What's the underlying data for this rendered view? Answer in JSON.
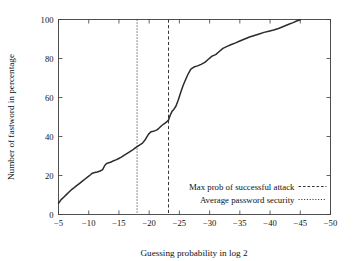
{
  "chart_data": {
    "type": "line",
    "title": "",
    "xlabel": "Guessing probability in log 2",
    "ylabel": "Number of fastword in percentage",
    "xlim": [
      -5,
      -50
    ],
    "ylim": [
      0,
      100
    ],
    "x_ticks": [
      -5,
      -10,
      -15,
      -20,
      -25,
      -30,
      -35,
      -40,
      -45,
      -50
    ],
    "x_tick_labels": [
      "-5",
      "-10",
      "-15",
      "-20",
      "-25",
      "-30",
      "-35",
      "-40",
      "-45",
      "-50"
    ],
    "y_ticks": [
      0,
      20,
      40,
      60,
      80,
      100
    ],
    "y_tick_labels": [
      "0",
      "20",
      "40",
      "60",
      "80",
      "100"
    ],
    "grid": false,
    "legend_position": "lower right",
    "series": [
      {
        "name": "fastword cumulative distribution",
        "style": "solid",
        "x": [
          -5.0,
          -5.4,
          -5.9,
          -6.3,
          -6.7,
          -7.1,
          -7.6,
          -8.0,
          -8.5,
          -9.0,
          -9.4,
          -9.9,
          -10.3,
          -10.6,
          -11.0,
          -11.4,
          -11.9,
          -12.3,
          -12.7,
          -13.0,
          -13.2,
          -13.6,
          -14.0,
          -14.5,
          -14.9,
          -15.4,
          -15.9,
          -16.3,
          -16.7,
          -17.0,
          -17.3,
          -17.6,
          -18.0,
          -18.4,
          -18.9,
          -19.4,
          -19.9,
          -20.3,
          -20.7,
          -21.0,
          -21.3,
          -21.6,
          -22.0,
          -22.4,
          -22.8,
          -23.2,
          -23.5,
          -23.8,
          -24.1,
          -24.4,
          -24.8,
          -25.2,
          -25.6,
          -26.0,
          -26.4,
          -26.9,
          -27.4,
          -28.0,
          -28.6,
          -29.2,
          -29.8,
          -30.4,
          -31.0,
          -31.6,
          -32.2,
          -32.9,
          -33.6,
          -34.3,
          -35.0,
          -35.8,
          -36.6,
          -37.4,
          -38.2,
          -39.0,
          -39.8,
          -40.6,
          -41.4,
          -42.2,
          -43.0,
          -43.8,
          -44.4,
          -45.0
        ],
        "y": [
          5.8,
          7.5,
          9.0,
          10.2,
          11.4,
          12.6,
          13.8,
          14.8,
          16.0,
          17.2,
          18.2,
          19.4,
          20.4,
          21.2,
          21.5,
          21.8,
          22.3,
          23.0,
          25.4,
          26.2,
          26.4,
          26.8,
          27.4,
          28.0,
          28.6,
          29.4,
          30.4,
          31.2,
          32.0,
          32.6,
          33.2,
          33.9,
          34.8,
          35.6,
          36.6,
          38.6,
          41.2,
          42.4,
          42.7,
          43.0,
          43.4,
          44.2,
          45.4,
          46.4,
          47.2,
          48.4,
          51.0,
          53.0,
          54.0,
          55.4,
          58.6,
          62.4,
          66.0,
          69.0,
          71.8,
          74.6,
          75.6,
          76.2,
          77.0,
          78.0,
          79.6,
          81.2,
          82.0,
          83.6,
          85.2,
          86.2,
          87.2,
          88.0,
          89.0,
          90.0,
          91.0,
          91.8,
          92.6,
          93.4,
          94.0,
          94.6,
          95.4,
          96.4,
          97.4,
          98.4,
          99.2,
          99.8
        ]
      }
    ],
    "vertical_lines": [
      {
        "name": "Max prob of successful attack",
        "x": -23.2,
        "style": "dashed"
      },
      {
        "name": "Average password security",
        "x": -18.0,
        "style": "dotted"
      }
    ],
    "legend": [
      {
        "label": "Max prob of successful attack",
        "style": "dashed"
      },
      {
        "label": "Average password security",
        "style": "dotted"
      }
    ]
  }
}
